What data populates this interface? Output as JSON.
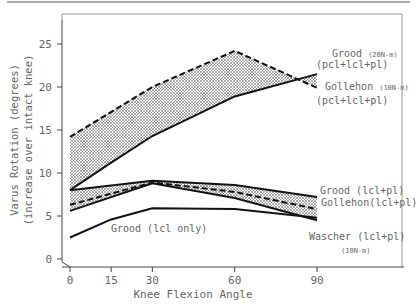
{
  "chart_data": {
    "type": "line",
    "title": "",
    "xlabel": "Knee Flexion Angle",
    "ylabel": "Varus Rotation (degrees)",
    "ylabel2": "(increase over intact knee)",
    "x": [
      0,
      15,
      30,
      60,
      90
    ],
    "xticks": [
      "0",
      "15",
      "30",
      "60",
      "90"
    ],
    "yticks": [
      "0",
      "5",
      "10",
      "15",
      "20",
      "25"
    ],
    "xlim": [
      0,
      90
    ],
    "ylim": [
      0,
      27
    ],
    "grid": false,
    "series": [
      {
        "name": "Grood (20N-m) (pcl+lcl+pl)",
        "style": "dashed",
        "x": [
          0,
          30,
          60,
          90
        ],
        "values": [
          14.2,
          20.0,
          24.2,
          19.9
        ]
      },
      {
        "name": "Gollehon (10N-m) (pcl+lcl+pl)",
        "style": "solid",
        "x": [
          0,
          15,
          30,
          60,
          90
        ],
        "values": [
          8.0,
          11.2,
          14.3,
          18.9,
          21.5
        ]
      },
      {
        "name": "Grood (lcl+pl)",
        "style": "solid",
        "x": [
          0,
          30,
          60,
          90
        ],
        "values": [
          8.0,
          9.1,
          8.6,
          7.2
        ]
      },
      {
        "name": "Gollehon (lcl+pl)",
        "style": "dashed",
        "x": [
          0,
          30,
          60,
          90
        ],
        "values": [
          6.3,
          8.9,
          7.8,
          5.8
        ]
      },
      {
        "name": "Wascher (lcl+pl) (10N-m)",
        "style": "solid",
        "x": [
          0,
          30,
          60,
          90
        ],
        "values": [
          5.6,
          8.8,
          7.1,
          4.5
        ]
      },
      {
        "name": "Grood (lcl only)",
        "style": "solid",
        "x": [
          0,
          15,
          30,
          60,
          90
        ],
        "values": [
          2.5,
          4.6,
          5.9,
          5.8,
          4.8
        ]
      }
    ],
    "annotations": [
      {
        "text": "Grood",
        "sub": "(20N-m)",
        "line2": "(pcl+lcl+pl)"
      },
      {
        "text": "Gollehon",
        "sub": "(10N-m)",
        "line2": "(pcl+lcl+pl)"
      },
      {
        "text": "Grood (lcl+pl)"
      },
      {
        "text": "Gollehon(lcl+pl)"
      },
      {
        "text": "Wascher (lcl+pl)",
        "line2": "(10N-m)"
      },
      {
        "text": "Grood (lcl only)"
      }
    ]
  }
}
